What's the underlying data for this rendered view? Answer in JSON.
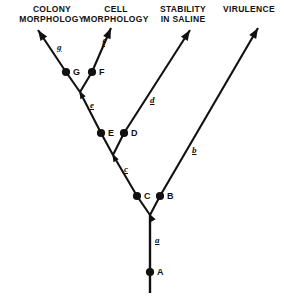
{
  "figure": {
    "type": "phylogenetic-tree-diagram",
    "background_color": "#ffffff",
    "line_color": "#111111",
    "width": 284,
    "height": 300
  },
  "headers": [
    {
      "id": "colony-morphology",
      "text": "COLONY\nMORPHOLOGY",
      "x": 14,
      "y": 4,
      "width": 76
    },
    {
      "id": "cell-morphology",
      "text": "CELL\nMORPHOLOGY",
      "x": 78,
      "y": 4,
      "width": 76
    },
    {
      "id": "stability-in-saline",
      "text": "STABILITY\nIN SALINE",
      "x": 152,
      "y": 4,
      "width": 62
    },
    {
      "id": "virulence",
      "text": "VIRULENCE",
      "x": 218,
      "y": 4,
      "width": 62
    }
  ],
  "nodes": [
    {
      "id": "A",
      "label": "A",
      "cx": 150,
      "cy": 272,
      "label_x": 157,
      "label_y": 268
    },
    {
      "id": "B",
      "label": "B",
      "cx": 160,
      "cy": 196,
      "label_x": 167,
      "label_y": 192
    },
    {
      "id": "C",
      "label": "C",
      "cx": 137,
      "cy": 196,
      "label_x": 144,
      "label_y": 192
    },
    {
      "id": "D",
      "label": "D",
      "cx": 124,
      "cy": 133,
      "label_x": 131,
      "label_y": 129
    },
    {
      "id": "E",
      "label": "E",
      "cx": 101,
      "cy": 133,
      "label_x": 108,
      "label_y": 129
    },
    {
      "id": "F",
      "label": "F",
      "cx": 92,
      "cy": 72,
      "label_x": 99,
      "label_y": 68
    },
    {
      "id": "G",
      "label": "G",
      "cx": 66,
      "cy": 72,
      "label_x": 73,
      "label_y": 68
    }
  ],
  "branch_labels": [
    {
      "id": "a",
      "text": "a",
      "x": 155,
      "y": 236
    },
    {
      "id": "b",
      "text": "b",
      "x": 192,
      "y": 146
    },
    {
      "id": "c",
      "text": "c",
      "x": 124,
      "y": 165
    },
    {
      "id": "d",
      "text": "d",
      "x": 150,
      "y": 96
    },
    {
      "id": "e",
      "text": "e",
      "x": 90,
      "y": 101
    },
    {
      "id": "f",
      "text": "f",
      "x": 102,
      "y": 38
    },
    {
      "id": "g",
      "text": "g",
      "x": 57,
      "y": 43
    }
  ],
  "segments": [
    {
      "id": "root-stem",
      "x1": 150,
      "y1": 293,
      "x2": 150,
      "y2": 215,
      "arrow": false
    },
    {
      "id": "junction-b-to-c-node",
      "x1": 150,
      "y1": 215,
      "x2": 137,
      "y2": 196,
      "arrow": false
    },
    {
      "id": "c-node-to-junction-d",
      "x1": 137,
      "y1": 196,
      "x2": 113,
      "y2": 155,
      "arrow": false
    },
    {
      "id": "junction-b-to-b-node",
      "x1": 150,
      "y1": 215,
      "x2": 160,
      "y2": 196,
      "arrow": false
    },
    {
      "id": "b-node-to-virulence",
      "x1": 160,
      "y1": 196,
      "x2": 258,
      "y2": 28,
      "arrow": true
    },
    {
      "id": "junction-d-to-e-node",
      "x1": 113,
      "y1": 155,
      "x2": 101,
      "y2": 133,
      "arrow": false
    },
    {
      "id": "e-node-to-junction-f",
      "x1": 101,
      "y1": 133,
      "x2": 80,
      "y2": 92,
      "arrow": false
    },
    {
      "id": "junction-d-to-d-node",
      "x1": 113,
      "y1": 155,
      "x2": 124,
      "y2": 133,
      "arrow": false
    },
    {
      "id": "d-node-to-stability",
      "x1": 124,
      "y1": 133,
      "x2": 190,
      "y2": 30,
      "arrow": true
    },
    {
      "id": "junction-f-to-g-node",
      "x1": 80,
      "y1": 92,
      "x2": 66,
      "y2": 72,
      "arrow": false
    },
    {
      "id": "g-node-to-colony",
      "x1": 66,
      "y1": 72,
      "x2": 38,
      "y2": 30,
      "arrow": true
    },
    {
      "id": "junction-f-to-f-node",
      "x1": 80,
      "y1": 92,
      "x2": 92,
      "y2": 72,
      "arrow": false
    },
    {
      "id": "f-node-to-cell",
      "x1": 92,
      "y1": 72,
      "x2": 111,
      "y2": 28,
      "arrow": true
    }
  ],
  "junction_arrows": [
    {
      "id": "junction-arrow-root",
      "x": 150,
      "y": 215,
      "angle": -28
    },
    {
      "id": "junction-arrow-mid",
      "x": 113,
      "y": 155,
      "angle": -28
    },
    {
      "id": "junction-arrow-upper",
      "x": 80,
      "y": 92,
      "angle": -28
    }
  ]
}
